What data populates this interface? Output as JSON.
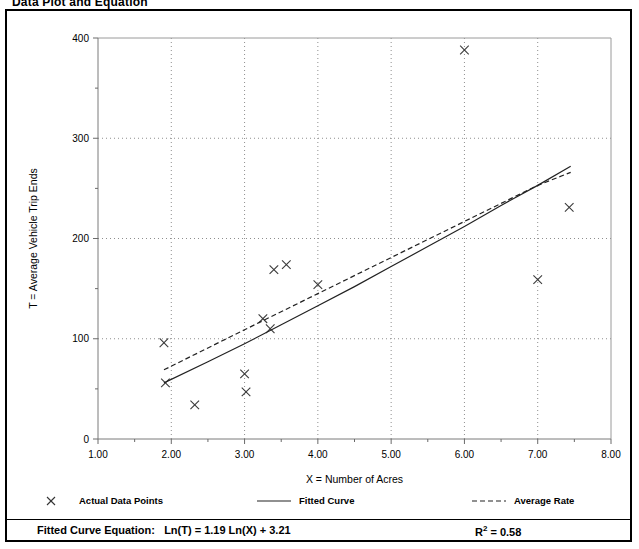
{
  "page_title": "Data Plot and Equation",
  "chart_data": {
    "type": "scatter",
    "title": "Data Plot and Equation",
    "xlabel": "X = Number of Acres",
    "ylabel": "T = Average Vehicle Trip Ends",
    "xlim": [
      1.0,
      8.0
    ],
    "ylim": [
      0,
      400
    ],
    "xticks": [
      "1.00",
      "2.00",
      "3.00",
      "4.00",
      "5.00",
      "6.00",
      "7.00",
      "8.00"
    ],
    "xtick_values": [
      1.0,
      2.0,
      3.0,
      4.0,
      5.0,
      6.0,
      7.0,
      8.0
    ],
    "xminor_step": 0.5,
    "yticks": [
      "0",
      "100",
      "200",
      "300",
      "400"
    ],
    "ytick_values": [
      0,
      100,
      200,
      300,
      400
    ],
    "grid": "dotted-both",
    "legend_position": "below-plot",
    "series": [
      {
        "name": "Actual Data Points",
        "marker": "x",
        "points": [
          {
            "x": 1.9,
            "y": 96
          },
          {
            "x": 1.92,
            "y": 56
          },
          {
            "x": 2.32,
            "y": 34
          },
          {
            "x": 3.0,
            "y": 65
          },
          {
            "x": 3.02,
            "y": 47
          },
          {
            "x": 3.25,
            "y": 120
          },
          {
            "x": 3.35,
            "y": 110
          },
          {
            "x": 3.4,
            "y": 169
          },
          {
            "x": 3.57,
            "y": 174
          },
          {
            "x": 4.0,
            "y": 154
          },
          {
            "x": 6.0,
            "y": 388
          },
          {
            "x": 7.0,
            "y": 159
          },
          {
            "x": 7.43,
            "y": 231
          }
        ]
      },
      {
        "name": "Fitted Curve",
        "style": "solid",
        "equation": "Ln(T) = 1.19 Ln(X) + 3.21",
        "x_start": 1.9,
        "x_end": 7.45,
        "points": [
          {
            "x": 1.9,
            "y": 56
          },
          {
            "x": 2.5,
            "y": 77
          },
          {
            "x": 3.0,
            "y": 95
          },
          {
            "x": 3.5,
            "y": 114
          },
          {
            "x": 4.0,
            "y": 133
          },
          {
            "x": 4.5,
            "y": 152
          },
          {
            "x": 5.0,
            "y": 172
          },
          {
            "x": 5.5,
            "y": 192
          },
          {
            "x": 6.0,
            "y": 212
          },
          {
            "x": 6.5,
            "y": 233
          },
          {
            "x": 7.0,
            "y": 253
          },
          {
            "x": 7.45,
            "y": 272
          }
        ]
      },
      {
        "name": "Average Rate",
        "style": "dashed",
        "x_start": 1.9,
        "x_end": 7.45,
        "points": [
          {
            "x": 1.9,
            "y": 69
          },
          {
            "x": 3.0,
            "y": 109
          },
          {
            "x": 4.0,
            "y": 145
          },
          {
            "x": 5.0,
            "y": 181
          },
          {
            "x": 6.0,
            "y": 217
          },
          {
            "x": 7.0,
            "y": 253
          },
          {
            "x": 7.45,
            "y": 266
          }
        ]
      }
    ]
  },
  "legend": {
    "items": [
      {
        "label": "Actual Data Points",
        "symbol": "x-marker"
      },
      {
        "label": "Fitted Curve",
        "symbol": "solid-line"
      },
      {
        "label": "Average Rate",
        "symbol": "dashed-line"
      }
    ]
  },
  "equation": {
    "prefix": "Fitted Curve Equation:",
    "formula": "Ln(T) = 1.19 Ln(X) + 3.21",
    "r_squared_label": "R",
    "r_squared_exp": "2",
    "r_squared_value": "= 0.58"
  }
}
